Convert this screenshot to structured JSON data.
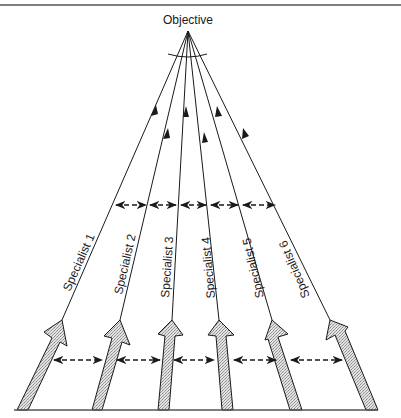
{
  "diagram": {
    "objective_label": "Objective",
    "specialists": [
      {
        "label": "Specialist 1"
      },
      {
        "label": "Specialist 2"
      },
      {
        "label": "Specialist 3"
      },
      {
        "label": "Specialist 4"
      },
      {
        "label": "Specialist 5"
      },
      {
        "label": "Specialist 6"
      }
    ],
    "colors": {
      "line": "#1a1a1a",
      "arrow_fill": "#c8c8c8",
      "border": "#555555"
    }
  }
}
